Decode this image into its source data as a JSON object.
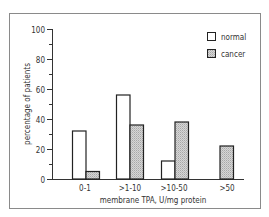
{
  "chart_data": {
    "type": "bar",
    "title": "",
    "xlabel": "membrane TPA, U/mg protein",
    "ylabel": "percentage of patients",
    "ylim": [
      0,
      100
    ],
    "yticks": [
      0,
      20,
      40,
      60,
      80,
      100
    ],
    "grid": false,
    "legend_position": "top-right",
    "categories": [
      "0-1",
      ">1-10",
      ">10-50",
      ">50"
    ],
    "series": [
      {
        "name": "normal",
        "fill": "white",
        "values": [
          32,
          56,
          12,
          0
        ]
      },
      {
        "name": "cancer",
        "fill": "hatched-gray",
        "values": [
          5,
          36,
          38,
          22
        ]
      }
    ]
  },
  "legend": {
    "items": [
      {
        "label": "normal"
      },
      {
        "label": "cancer"
      }
    ]
  },
  "axes": {
    "y_tick_labels": [
      "0",
      "20",
      "40",
      "60",
      "80",
      "100"
    ],
    "x_tick_labels": [
      "0-1",
      ">1-10",
      ">10-50",
      ">50"
    ],
    "x_title": "membrane TPA, U/mg protein",
    "y_title": "percentage of patients"
  }
}
